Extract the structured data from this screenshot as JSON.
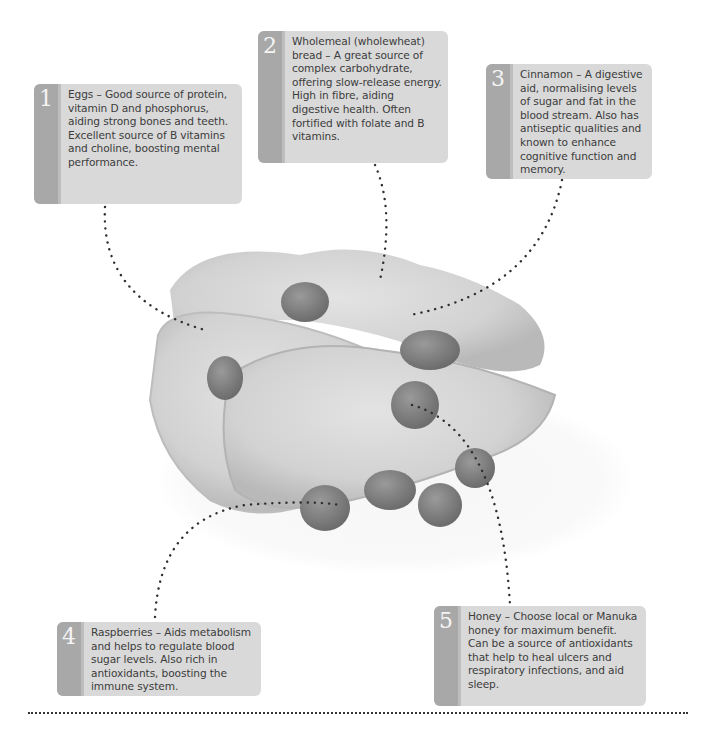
{
  "callouts": [
    {
      "number": "1",
      "title": "Eggs",
      "text": "Eggs – Good source of protein, vitamin D and phosphorus, aiding strong bones and teeth. Excellent source of B vitamins and choline, boosting mental performance."
    },
    {
      "number": "2",
      "title": "Wholemeal (wholewheat) bread",
      "text": "Wholemeal (wholewheat) bread – A great source of complex carbohydrate, offering slow-release energy. High in fibre, aiding digestive health. Often fortified with folate and B vitamins."
    },
    {
      "number": "3",
      "title": "Cinnamon",
      "text": "Cinnamon – A digestive aid, normalising levels of sugar and fat in the blood stream. Also has antiseptic qualities and known to enhance cognitive function and memory."
    },
    {
      "number": "4",
      "title": "Raspberries",
      "text": "Raspberries – Aids metabolism and helps to regulate blood sugar levels. Also rich in antioxidants, boosting the immune system."
    },
    {
      "number": "5",
      "title": "Honey",
      "text": "Honey – Choose local or Manuka honey for maximum benefit. Can be a source of antioxidants that help to heal ulcers and respiratory infections, and aid sleep."
    }
  ],
  "image": {
    "subject": "french-toast-with-raspberries-and-honey"
  },
  "colors": {
    "box_bg": "#d9d9d9",
    "strip": "#a8a8a8",
    "text": "#3c3c3c",
    "dots": "#333333"
  }
}
